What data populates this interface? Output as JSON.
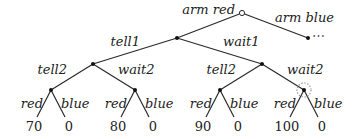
{
  "diagram": {
    "type": "game-tree",
    "root": {
      "edges": [
        {
          "label": "arm red",
          "child": "n_tell1"
        },
        {
          "label": "arm blue",
          "child": "n_blue",
          "continuation": "⋯"
        }
      ]
    },
    "level1": {
      "left_label": "tell1",
      "right_label": "wait1"
    },
    "level2": [
      {
        "left_label": "tell2",
        "right_label": "wait2"
      },
      {
        "left_label": "tell2",
        "right_label": "wait2",
        "highlighted": true
      }
    ],
    "leaves": [
      {
        "edge_label": "red",
        "value": "70"
      },
      {
        "edge_label": "blue",
        "value": "0"
      },
      {
        "edge_label": "red",
        "value": "80"
      },
      {
        "edge_label": "blue",
        "value": "0"
      },
      {
        "edge_label": "red",
        "value": "90"
      },
      {
        "edge_label": "blue",
        "value": "0"
      },
      {
        "edge_label": "red",
        "value": "100"
      },
      {
        "edge_label": "blue",
        "value": "0"
      }
    ],
    "colors": {
      "edge": "#2a2a2a",
      "text": "#222222",
      "highlight_ring": "#999999"
    }
  }
}
